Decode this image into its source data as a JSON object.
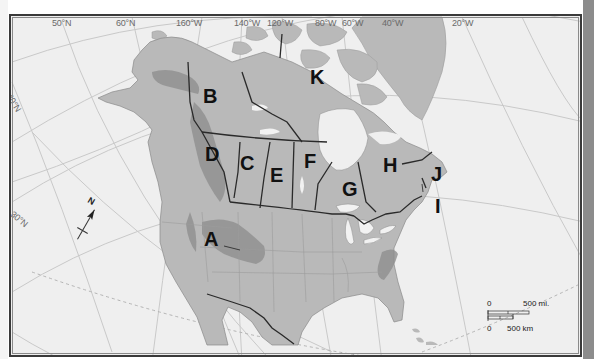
{
  "map": {
    "title": "",
    "colors": {
      "ocean": "#efefef",
      "land": "#b9b9b9",
      "land_dark": "#a4a4a4",
      "graticule": "#c8c8c8",
      "borders": "#2a2a2a",
      "water_inland": "#f2f2f2"
    },
    "graticule_labels": {
      "top": [
        "50°N",
        "60°N",
        "160°W",
        "140°W",
        "120°W",
        "80°W",
        "60°W",
        "40°W",
        "20°W"
      ],
      "left": [
        "40°N",
        "30°N"
      ]
    },
    "region_labels": [
      "A",
      "B",
      "C",
      "D",
      "E",
      "F",
      "G",
      "H",
      "I",
      "J",
      "K"
    ],
    "north_arrow": {
      "label": "N"
    },
    "scale_bar": {
      "top_zero": "0",
      "top_label": "500 mi.",
      "bottom_zero": "0",
      "bottom_label": "500 km"
    }
  }
}
